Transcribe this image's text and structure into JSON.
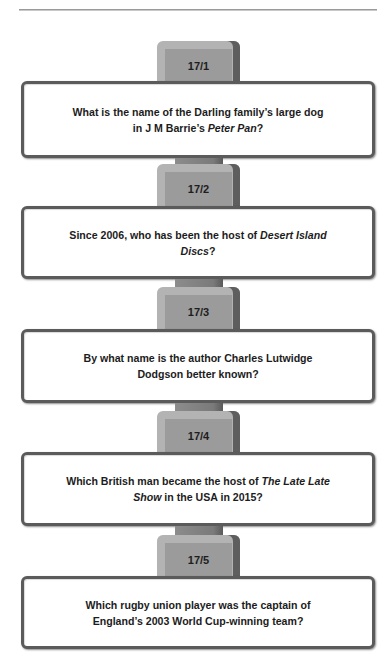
{
  "questions": [
    {
      "number": "17/1",
      "line1": [
        "What is the name of the Darling family’s large dog"
      ],
      "line2": [
        "in J M Barrie’s ",
        "Peter Pan",
        "?"
      ]
    },
    {
      "number": "17/2",
      "line1": [
        "Since 2006, who has been the host of ",
        "Desert Island"
      ],
      "line2": [
        "Discs",
        "?"
      ]
    },
    {
      "number": "17/3",
      "line1": [
        "By what name is the author Charles Lutwidge"
      ],
      "line2": [
        "Dodgson better known?"
      ]
    },
    {
      "number": "17/4",
      "line1": [
        "Which British man became the host of ",
        "The Late Late"
      ],
      "line2": [
        "Show",
        " in the USA in 2015?"
      ]
    },
    {
      "number": "17/5",
      "line1": [
        "Which rugby union player was the captain of"
      ],
      "line2": [
        "England’s 2003 World Cup-winning team?"
      ]
    }
  ],
  "colors": {
    "box_border": "#5b5b5b",
    "tab_face": "#9b9b9b",
    "tab_bevel": "#b3b3b3",
    "tab_side": "#5e5e5e",
    "text": "#1c1c1c"
  }
}
